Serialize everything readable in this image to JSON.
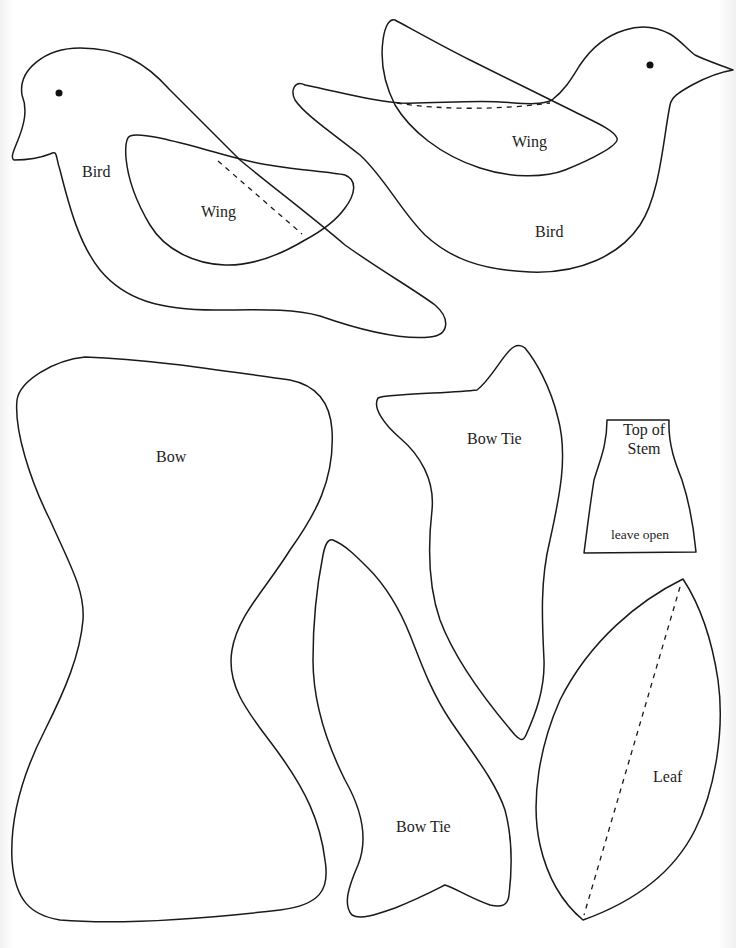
{
  "document": {
    "type": "sewing pattern template sheet",
    "header_text_visible": "",
    "colors": {
      "outline": "#1a1a1a",
      "background": "#ffffff",
      "label": "#1d1d1d"
    }
  },
  "pieces": {
    "bird_left": {
      "label": "Bird",
      "has_eye": true,
      "facing": "left"
    },
    "wing_left": {
      "label": "Wing",
      "fold_line": "dashed"
    },
    "bird_right": {
      "label": "Bird",
      "has_eye": true,
      "facing": "right"
    },
    "wing_right": {
      "label": "Wing",
      "fold_line": "dashed"
    },
    "bow": {
      "label": "Bow"
    },
    "bow_tie_top": {
      "label": "Bow Tie"
    },
    "bow_tie_bottom": {
      "label": "Bow Tie"
    },
    "top_of_stem": {
      "label_line1": "Top of",
      "label_line2": "Stem",
      "note": "leave open"
    },
    "leaf": {
      "label": "Leaf",
      "fold_line": "dashed"
    }
  }
}
